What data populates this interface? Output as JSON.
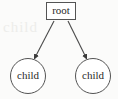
{
  "diagram": {
    "type": "tree",
    "background_color": "#fbfbfa",
    "stroke_color": "#545454",
    "text_color": "#2a2a2a",
    "arrow_color": "#3a3a3a",
    "node_fill": "#ffffff",
    "nodes": [
      {
        "id": "root",
        "label": "root",
        "shape": "rectangle",
        "cx": 61,
        "cy": 11,
        "width": 30,
        "height": 18
      },
      {
        "id": "child-left",
        "label": "child",
        "shape": "ellipse",
        "cx": 28,
        "cy": 76,
        "rx": 18,
        "ry": 18
      },
      {
        "id": "child-right",
        "label": "child",
        "shape": "ellipse",
        "cx": 93,
        "cy": 76,
        "rx": 18,
        "ry": 18
      }
    ],
    "edges": [
      {
        "id": "edge-root-to-left-child",
        "from": "root",
        "to": "child-left",
        "arrowhead": "filled-triangle",
        "x1": 54,
        "y1": 21,
        "x2": 34,
        "y2": 59
      },
      {
        "id": "edge-root-to-right-child",
        "from": "root",
        "to": "child-right",
        "arrowhead": "filled-triangle",
        "x1": 68,
        "y1": 21,
        "x2": 87,
        "y2": 59
      }
    ],
    "watermark_text": "child"
  }
}
